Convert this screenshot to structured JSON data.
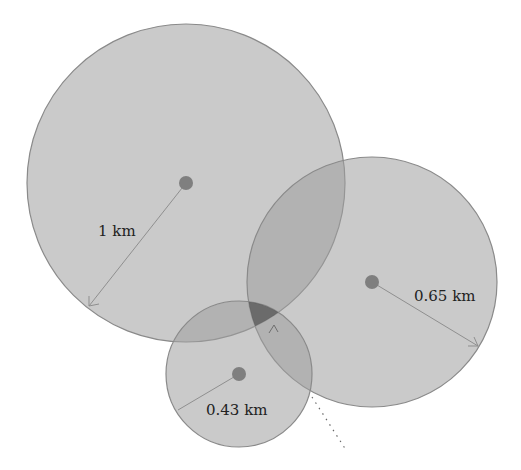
{
  "diagram": {
    "circles": [
      {
        "id": "circle-1km",
        "radius_label": "1 km",
        "radius_km": 1.0
      },
      {
        "id": "circle-065km",
        "radius_label": "0.65 km",
        "radius_km": 0.65
      },
      {
        "id": "circle-043km",
        "radius_label": "0.43 km",
        "radius_km": 0.43
      }
    ],
    "intersection_marker": "^",
    "colors": {
      "circle_fill": "#9e9e9e",
      "intersection_dark": "#4a4a4a",
      "text": "#222222"
    }
  }
}
